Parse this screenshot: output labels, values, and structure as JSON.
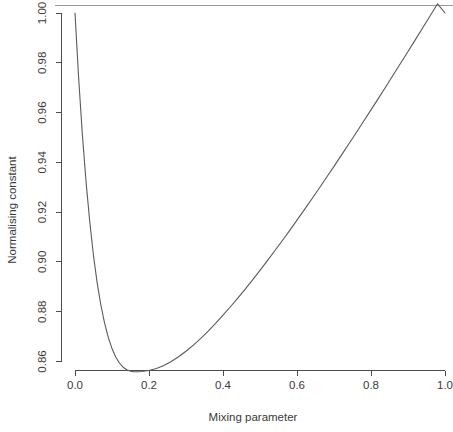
{
  "chart_data": {
    "type": "line",
    "title": "",
    "xlabel": "Mixing parameter",
    "ylabel": "Normalising constant",
    "xlim": [
      0.0,
      1.0
    ],
    "ylim": [
      0.858,
      1.002
    ],
    "grid": false,
    "legend": null,
    "x_ticks": [
      0.0,
      0.2,
      0.4,
      0.6,
      0.8,
      1.0
    ],
    "x_tick_labels": [
      "0.0",
      "0.2",
      "0.4",
      "0.6",
      "0.8",
      "1.0"
    ],
    "y_ticks": [
      0.86,
      0.88,
      0.9,
      0.92,
      0.94,
      0.96,
      0.98,
      1.0
    ],
    "y_tick_labels": [
      "0.86",
      "0.88",
      "0.90",
      "0.92",
      "0.94",
      "0.96",
      "0.98",
      "1.00"
    ],
    "series": [
      {
        "name": "Normalising constant",
        "color": "#5a5a5a",
        "x": [
          0.0,
          0.01,
          0.02,
          0.03,
          0.04,
          0.05,
          0.06,
          0.07,
          0.08,
          0.09,
          0.1,
          0.11,
          0.12,
          0.13,
          0.14,
          0.15,
          0.16,
          0.17,
          0.18,
          0.19,
          0.2,
          0.22,
          0.24,
          0.26,
          0.28,
          0.3,
          0.32,
          0.34,
          0.36,
          0.38,
          0.4,
          0.42,
          0.44,
          0.46,
          0.48,
          0.5,
          0.52,
          0.54,
          0.56,
          0.58,
          0.6,
          0.62,
          0.64,
          0.66,
          0.68,
          0.7,
          0.72,
          0.74,
          0.76,
          0.78,
          0.8,
          0.82,
          0.84,
          0.86,
          0.88,
          0.9,
          0.92,
          0.94,
          0.96,
          0.98,
          1.0
        ],
        "y": [
          1.0,
          0.9735,
          0.951,
          0.932,
          0.916,
          0.9025,
          0.8915,
          0.8826,
          0.8754,
          0.8697,
          0.8652,
          0.8618,
          0.8594,
          0.8577,
          0.8567,
          0.8561,
          0.8559,
          0.8559,
          0.856,
          0.8562,
          0.8564,
          0.8572,
          0.8584,
          0.86,
          0.8619,
          0.8641,
          0.8666,
          0.8693,
          0.8722,
          0.8753,
          0.8786,
          0.882,
          0.8855,
          0.8891,
          0.8928,
          0.8966,
          0.9005,
          0.9045,
          0.9085,
          0.9126,
          0.9168,
          0.921,
          0.9253,
          0.9296,
          0.934,
          0.9384,
          0.9429,
          0.9474,
          0.9519,
          0.9565,
          0.9611,
          0.9657,
          0.9704,
          0.9751,
          0.9798,
          0.9845,
          0.9893,
          0.9941,
          0.9989,
          1.0037,
          1.0
        ]
      }
    ],
    "annotations": {
      "minimum_x": 0.17,
      "minimum_y": 0.8559,
      "start_y": 1.0,
      "end_y": 1.0
    }
  }
}
